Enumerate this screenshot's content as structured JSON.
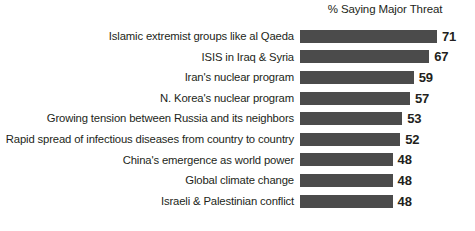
{
  "chart_data": {
    "type": "bar",
    "orientation": "horizontal",
    "title": "",
    "subtitle": "",
    "column_header": "% Saying Major Threat",
    "xlabel": "",
    "ylabel": "",
    "xlim": [
      0,
      71
    ],
    "grid": false,
    "legend": null,
    "bar_color": "#4b4b4b",
    "background_color": "#ffffff",
    "value_suffix": "",
    "categories": [
      "Islamic extremist groups like al Qaeda",
      "ISIS in Iraq & Syria",
      "Iran's nuclear program",
      "N. Korea's nuclear program",
      "Growing tension between Russia and its neighbors",
      "Rapid spread of infectious diseases from country to country",
      "China's emergence as world power",
      "Global climate change",
      "Israeli & Palestinian conflict"
    ],
    "values": [
      71,
      67,
      59,
      57,
      53,
      52,
      48,
      48,
      48
    ],
    "rows": [
      {
        "label": "Islamic extremist groups like al Qaeda",
        "value": 71,
        "value_text": "71"
      },
      {
        "label": "ISIS in Iraq & Syria",
        "value": 67,
        "value_text": "67"
      },
      {
        "label": "Iran's nuclear program",
        "value": 59,
        "value_text": "59"
      },
      {
        "label": "N. Korea's nuclear program",
        "value": 57,
        "value_text": "57"
      },
      {
        "label": "Growing tension between Russia and its neighbors",
        "value": 53,
        "value_text": "53"
      },
      {
        "label": "Rapid spread of infectious diseases from country to country",
        "value": 52,
        "value_text": "52"
      },
      {
        "label": "China's emergence as world power",
        "value": 48,
        "value_text": "48"
      },
      {
        "label": "Global climate change",
        "value": 48,
        "value_text": "48"
      },
      {
        "label": "Israeli & Palestinian conflict",
        "value": 48,
        "value_text": "48"
      }
    ]
  }
}
